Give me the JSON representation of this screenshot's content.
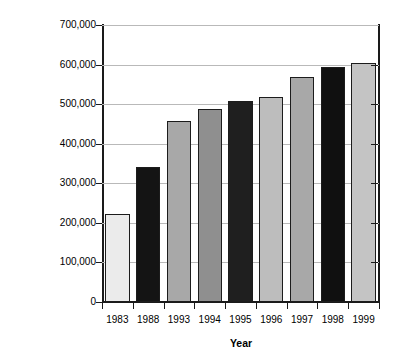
{
  "chart_data": {
    "type": "bar",
    "title": "",
    "xlabel": "Year",
    "ylabel": "Population",
    "categories": [
      "1983",
      "1988",
      "1993",
      "1994",
      "1995",
      "1996",
      "1997",
      "1998",
      "1999"
    ],
    "values": [
      223000,
      342000,
      457000,
      489000,
      507000,
      517000,
      568000,
      593000,
      604000
    ],
    "bar_colors": [
      "#ebebeb",
      "#141414",
      "#a8a8a8",
      "#8f8f8f",
      "#1f1f1f",
      "#bdbdbd",
      "#a8a8a8",
      "#101010",
      "#c4c4c4"
    ],
    "ylim": [
      0,
      700000
    ],
    "yticks": [
      0,
      100000,
      200000,
      300000,
      400000,
      500000,
      600000,
      700000
    ],
    "ytick_labels": [
      "0",
      "100,000",
      "200,000",
      "300,000",
      "400,000",
      "500,000",
      "600,000",
      "700,000"
    ],
    "grid": true,
    "legend": false,
    "bar_edge_color": "#1c1c1c",
    "axis_color": "#1a1a1a",
    "gridline_color": "#b9b9b9",
    "background": "#ffffff"
  }
}
